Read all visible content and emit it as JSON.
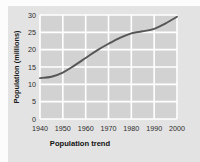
{
  "figure": {
    "background_color": "#fcfcfc",
    "card_color": "#e3e3e3"
  },
  "chart_data": {
    "type": "line",
    "title": "",
    "xlabel": "Population trend",
    "ylabel": "Population (millions)",
    "xlim": [
      1940,
      2000
    ],
    "ylim": [
      0,
      30
    ],
    "grid": true,
    "legend": "none",
    "plot_background_color": "#d2d2d2",
    "gridline_color": "#ffffff",
    "line_color": "#565656",
    "x_tick_labels": [
      "1940",
      "1950",
      "1960",
      "1970",
      "1980",
      "1990",
      "2000"
    ],
    "y_tick_labels": [
      "0",
      "5",
      "10",
      "15",
      "20",
      "25",
      "30"
    ],
    "x_ticks": [
      1940,
      1950,
      1960,
      1970,
      1980,
      1990,
      2000
    ],
    "y_ticks": [
      0,
      5,
      10,
      15,
      20,
      25,
      30
    ],
    "series": [
      {
        "name": "Population",
        "x": [
          1940,
          1945,
          1950,
          1955,
          1960,
          1965,
          1970,
          1975,
          1980,
          1983,
          1985,
          1990,
          1995,
          2000
        ],
        "values": [
          11.8,
          12.2,
          13.4,
          15.4,
          17.6,
          19.8,
          21.7,
          23.4,
          24.7,
          25.1,
          25.3,
          26.0,
          27.6,
          29.5
        ]
      }
    ]
  }
}
